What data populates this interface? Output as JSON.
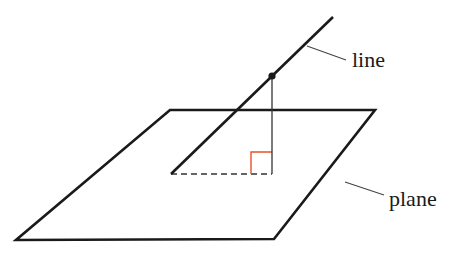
{
  "diagram": {
    "type": "geometry",
    "labels": {
      "line": "line",
      "plane": "plane"
    },
    "colors": {
      "stroke": "#1a1a1a",
      "thin_stroke": "#444444",
      "right_angle_marker": "#e8502a",
      "background": "#ffffff"
    },
    "elements": [
      {
        "id": "plane",
        "kind": "parallelogram",
        "label": "plane"
      },
      {
        "id": "line",
        "kind": "line",
        "label": "line"
      },
      {
        "id": "point",
        "kind": "point",
        "on": "line"
      },
      {
        "id": "perpendicular",
        "kind": "segment",
        "from": "point",
        "to": "foot-on-plane"
      },
      {
        "id": "projection",
        "kind": "dashed-segment",
        "on": "plane"
      },
      {
        "id": "right-angle",
        "kind": "marker",
        "at": "foot-on-plane"
      }
    ]
  }
}
